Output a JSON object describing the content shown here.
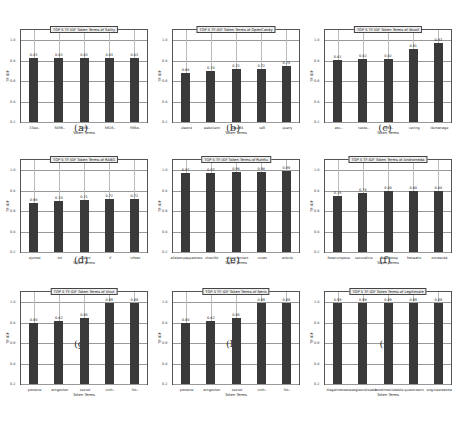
{
  "chart_data": [
    {
      "type": "bar",
      "panel": "a",
      "title": "TOP 5 TF-IDF Token Terms of Sality",
      "xlabel": "Token Terms",
      "ylabel": "TF-IDF",
      "ylim": [
        0.2,
        1.1
      ],
      "yticks": [
        "0.2",
        "0.4",
        "0.6",
        "0.8",
        "1.0"
      ],
      "grid": true,
      "categories": [
        "33ee..",
        "5456..",
        "5456..",
        "5616..",
        "598a.."
      ],
      "values": [
        0.83,
        0.83,
        0.83,
        0.83,
        0.83
      ],
      "value_labels": [
        "0.83",
        "0.83",
        "0.83",
        "0.83",
        "0.83"
      ]
    },
    {
      "type": "bar",
      "panel": "b",
      "title": "TOP 5 TF-IDF Token Terms of OpenCandy",
      "xlabel": "Token Terms",
      "ylabel": "TF-IDF",
      "ylim": [
        0.2,
        1.1
      ],
      "yticks": [
        "0.2",
        "0.4",
        "0.6",
        "0.8",
        "1.0"
      ],
      "grid": true,
      "categories": [
        "dword",
        "webclient",
        "base64",
        "sd5",
        "query"
      ],
      "values": [
        0.68,
        0.7,
        0.72,
        0.72,
        0.75
      ],
      "value_labels": [
        "0.68",
        "0.70",
        "0.72",
        "0.72",
        "0.75"
      ]
    },
    {
      "type": "bar",
      "panel": "c",
      "title": "TOP 5 TF-IDF Token Terms of Wuxif",
      "xlabel": "Token Terms",
      "ylabel": "TF-IDF",
      "ylim": [
        0.2,
        1.1
      ],
      "yticks": [
        "0.2",
        "0.4",
        "0.6",
        "0.8",
        "1.0"
      ],
      "grid": true,
      "categories": [
        "ass..",
        "texte..",
        "fx65..",
        "vering",
        "libmanage"
      ],
      "values": [
        0.81,
        0.82,
        0.82,
        0.91,
        0.97
      ],
      "value_labels": [
        "0.81",
        "0.82",
        "0.82",
        "0.91",
        "0.97"
      ]
    },
    {
      "type": "bar",
      "panel": "d",
      "title": "TOP 5 TF-IDF Token Terms of RABG",
      "xlabel": "Token Terms",
      "ylabel": "TF-IDF",
      "ylim": [
        0.2,
        1.1
      ],
      "yticks": [
        "0.2",
        "0.4",
        "0.6",
        "0.8",
        "1.0"
      ],
      "grid": true,
      "categories": [
        "dymod",
        "txt",
        "import",
        "if",
        "infoac"
      ],
      "values": [
        0.68,
        0.7,
        0.71,
        0.72,
        0.72
      ],
      "value_labels": [
        "0.68",
        "0.70",
        "0.71",
        "0.72",
        "0.72"
      ]
    },
    {
      "type": "bar",
      "panel": "e",
      "title": "TOP 5 TF-IDF Token Terms of Runfiu",
      "xlabel": "Token Terms",
      "ylabel": "TF-IDF",
      "ylim": [
        0.2,
        1.1
      ],
      "yticks": [
        "0.2",
        "0.4",
        "0.6",
        "0.8",
        "1.0"
      ],
      "grid": true,
      "categories": [
        "allabonyappadress",
        "checkfo",
        "useinconnect",
        "runas",
        "airbnb"
      ],
      "values": [
        0.97,
        0.97,
        0.98,
        0.98,
        0.99
      ],
      "value_labels": [
        "0.97",
        "0.97",
        "0.98",
        "0.98",
        "0.99"
      ]
    },
    {
      "type": "bar",
      "panel": "f",
      "title": "TOP 5 TF-IDF Token Terms of Androrneda",
      "xlabel": "Token Terms",
      "ylabel": "TF-IDF",
      "ylim": [
        0.2,
        1.1
      ],
      "yticks": [
        "0.2",
        "0.4",
        "0.6",
        "0.8",
        "1.0"
      ],
      "grid": true,
      "categories": [
        "fooerumpose",
        "secureline",
        "recoiestop",
        "foowatis",
        "onrawida"
      ],
      "values": [
        0.75,
        0.78,
        0.8,
        0.8,
        0.8
      ],
      "value_labels": [
        "0.75",
        "0.78",
        "0.80",
        "0.80",
        "0.80"
      ]
    },
    {
      "type": "bar",
      "panel": "g",
      "title": "TOP 5 TF-IDF Token Terms of Virut",
      "xlabel": "Token Terms",
      "ylabel": "TF-IDF",
      "ylim": [
        0.2,
        1.1
      ],
      "yticks": [
        "0.2",
        "0.4",
        "0.6",
        "0.8",
        "1.0"
      ],
      "grid": true,
      "categories": [
        "postene",
        "amgosher",
        "secret",
        "cmh..",
        "fsk.."
      ],
      "values": [
        0.8,
        0.82,
        0.85,
        0.99,
        0.99
      ],
      "value_labels": [
        "0.80",
        "0.82",
        "0.85",
        "0.99",
        "0.99"
      ]
    },
    {
      "type": "bar",
      "panel": "h",
      "title": "TOP 5 TF-IDF Token Terms of Neris",
      "xlabel": "Token Terms",
      "ylabel": "TF-IDF",
      "ylim": [
        0.2,
        1.1
      ],
      "yticks": [
        "0.2",
        "0.4",
        "0.6",
        "0.8",
        "1.0"
      ],
      "grid": true,
      "categories": [
        "postene",
        "amgosher",
        "secret",
        "cmh..",
        "fsk.."
      ],
      "values": [
        0.8,
        0.82,
        0.85,
        0.99,
        0.99
      ],
      "value_labels": [
        "0.80",
        "0.82",
        "0.85",
        "0.99",
        "0.99"
      ]
    },
    {
      "type": "bar",
      "panel": "i",
      "title": "TOP 5 TF-IDF Token Terms of Legitimate",
      "xlabel": "Token Terms",
      "ylabel": "TF-IDF",
      "ylim": [
        0.2,
        1.1
      ],
      "yticks": [
        "0.2",
        "0.4",
        "0.6",
        "0.8",
        "1.0"
      ],
      "grid": true,
      "categories": [
        "illegalmoteeta",
        "eagleendiseale",
        "hotelmobiletable",
        "questcoeric",
        "engineeroastte"
      ],
      "values": [
        0.99,
        0.99,
        0.99,
        0.99,
        0.99
      ],
      "value_labels": [
        "0.99",
        "0.99",
        "0.99",
        "0.99",
        "0.99"
      ]
    }
  ],
  "captions": [
    "(a)",
    "(b)",
    "(c)",
    "(d)",
    "(e)",
    "(f)",
    "(g)",
    "(h)",
    "(i)"
  ]
}
